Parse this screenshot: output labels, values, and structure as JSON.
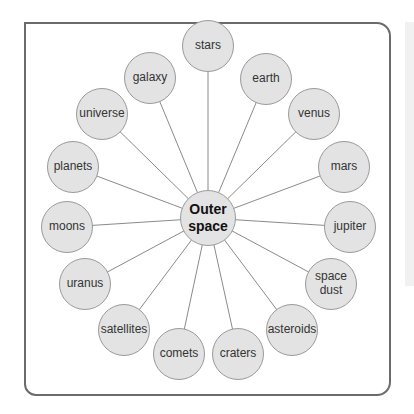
{
  "diagram": {
    "type": "mind-map",
    "center": {
      "label_line1": "Outer",
      "label_line2": "space",
      "x": 208,
      "y": 218
    },
    "nodes": [
      {
        "label": "stars",
        "x": 208,
        "y": 46
      },
      {
        "label": "earth",
        "x": 266,
        "y": 79
      },
      {
        "label": "venus",
        "x": 314,
        "y": 114
      },
      {
        "label": "mars",
        "x": 344,
        "y": 167
      },
      {
        "label": "jupiter",
        "x": 350,
        "y": 227
      },
      {
        "label": "space dust",
        "x": 331,
        "y": 284
      },
      {
        "label": "asteroids",
        "x": 292,
        "y": 330
      },
      {
        "label": "craters",
        "x": 238,
        "y": 354
      },
      {
        "label": "comets",
        "x": 179,
        "y": 354
      },
      {
        "label": "satellites",
        "x": 124,
        "y": 330
      },
      {
        "label": "uranus",
        "x": 85,
        "y": 284
      },
      {
        "label": "moons",
        "x": 67,
        "y": 227
      },
      {
        "label": "planets",
        "x": 73,
        "y": 167
      },
      {
        "label": "universe",
        "x": 102,
        "y": 114
      },
      {
        "label": "galaxy",
        "x": 150,
        "y": 78
      }
    ],
    "colors": {
      "node_fill": "#e3e3e3",
      "node_border": "#9a9a9a",
      "line": "#8a8a8a",
      "frame": "#6b6b6b"
    }
  }
}
